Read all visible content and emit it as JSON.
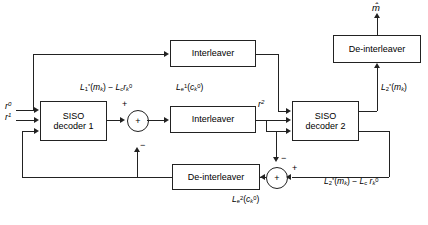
{
  "diagram": {
    "type": "block-diagram",
    "background": "#ffffff",
    "line_color": "#222222"
  },
  "blocks": {
    "siso1": {
      "line1": "SISO",
      "line2": "decoder 1"
    },
    "siso2": {
      "line1": "SISO",
      "line2": "decoder 2"
    },
    "interleaver_top": {
      "label": "Interleaver"
    },
    "interleaver_mid": {
      "label": "Interleaver"
    },
    "deinterleaver_top": {
      "label": "De-interleaver"
    },
    "deinterleaver_bottom": {
      "label": "De-interleaver"
    }
  },
  "summers": {
    "left": {
      "inside": "+",
      "input_top": "+",
      "input_bottom": "−"
    },
    "right": {
      "inside": "+",
      "input_top": "−",
      "input_right": "+"
    }
  },
  "signals": {
    "input_r0": "r⁰",
    "input_r1": "r¹",
    "interleaved_r2": "r²",
    "output_m_hat": "m̂",
    "extrinsic1": "L₁*(mₖ) − L_c rₖ⁰",
    "extrinsic1_e": "Lₑ¹(cₖ⁰)",
    "llr2": "L₂*(mₖ)",
    "extrinsic2": "L₂*(mₖ) − L_c rₖ⁰",
    "extrinsic2_e": "Lₑ²(cₖ⁰)"
  }
}
